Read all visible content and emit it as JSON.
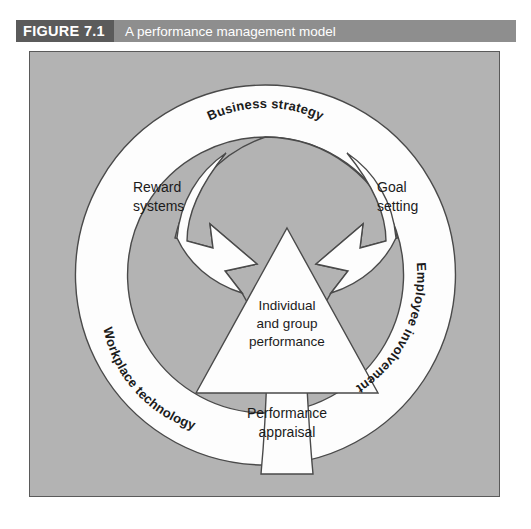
{
  "figure": {
    "number": "FIGURE 7.1",
    "title": "A performance management model",
    "number_band_color": "#5b5b5b",
    "title_band_color": "#8e8e8e"
  },
  "diagram": {
    "panel_background": "#b3b3b3",
    "shape_fill": "#fdfdfd",
    "stroke_color": "#4a4a4a",
    "type": "cycle-model",
    "ring_labels": [
      {
        "id": "business-strategy",
        "text": "Business strategy",
        "position": "top",
        "curved": true
      },
      {
        "id": "employee-involvement",
        "text": "Employee involvement",
        "position": "right",
        "curved": true
      },
      {
        "id": "workplace-technology",
        "text": "Workplace technology",
        "position": "bottom-left",
        "curved": true
      }
    ],
    "inner_labels": [
      {
        "id": "reward-systems",
        "line1": "Reward",
        "line2": "systems",
        "position": "left"
      },
      {
        "id": "goal-setting",
        "line1": "Goal",
        "line2": "setting",
        "position": "right"
      },
      {
        "id": "performance-appraisal",
        "line1": "Performance",
        "line2": "appraisal",
        "position": "bottom"
      }
    ],
    "core": {
      "id": "individual-and-group-performance",
      "line1": "Individual",
      "line2": "and group",
      "line3": "performance",
      "shape": "triangle"
    },
    "arrows": [
      {
        "id": "arrow-from-upper-left",
        "direction": "down-right",
        "target": "core"
      },
      {
        "id": "arrow-from-upper-right",
        "direction": "down-left",
        "target": "core"
      },
      {
        "id": "arrow-from-bottom",
        "direction": "up",
        "target": "core"
      }
    ]
  }
}
